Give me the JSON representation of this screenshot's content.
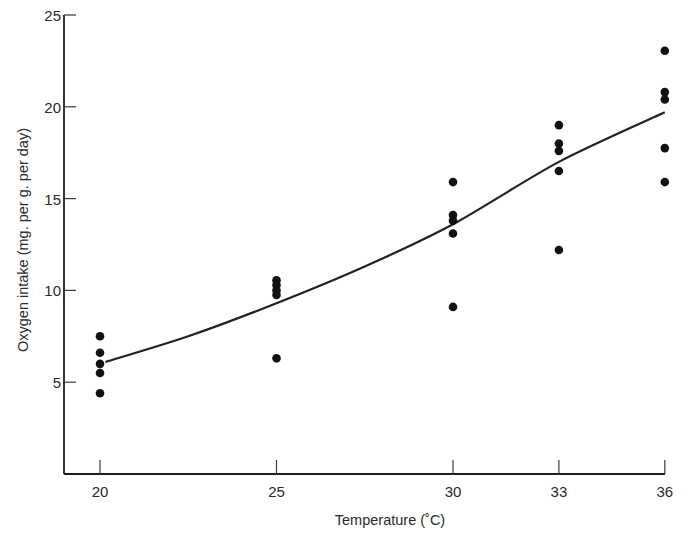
{
  "chart_data": {
    "type": "scatter",
    "title": "",
    "xlabel": "Temperature (˚C)",
    "ylabel": "Oxygen intake (mg. per g. per day)",
    "xlim": [
      18.95,
      36
    ],
    "ylim": [
      0,
      25
    ],
    "grid": false,
    "legend": null,
    "x_ticks": [
      20,
      25,
      30,
      33,
      36
    ],
    "x_tick_labels": [
      "20",
      "25",
      "30",
      "33",
      "36"
    ],
    "y_ticks": [
      5,
      10,
      15,
      20,
      25
    ],
    "y_tick_labels": [
      "5",
      "10",
      "15",
      "20",
      "25"
    ],
    "series": [
      {
        "name": "Observations",
        "kind": "scatter",
        "points": [
          {
            "x": 20,
            "y": 7.5
          },
          {
            "x": 20,
            "y": 6.6
          },
          {
            "x": 20,
            "y": 6.0
          },
          {
            "x": 20,
            "y": 5.5
          },
          {
            "x": 20,
            "y": 4.4
          },
          {
            "x": 25,
            "y": 10.55
          },
          {
            "x": 25,
            "y": 10.3
          },
          {
            "x": 25,
            "y": 10.0
          },
          {
            "x": 25,
            "y": 9.75
          },
          {
            "x": 25,
            "y": 6.3
          },
          {
            "x": 30,
            "y": 15.9
          },
          {
            "x": 30,
            "y": 14.1
          },
          {
            "x": 30,
            "y": 13.8
          },
          {
            "x": 30,
            "y": 13.1
          },
          {
            "x": 30,
            "y": 9.1
          },
          {
            "x": 33,
            "y": 19.0
          },
          {
            "x": 33,
            "y": 18.0
          },
          {
            "x": 33,
            "y": 17.6
          },
          {
            "x": 33,
            "y": 16.5
          },
          {
            "x": 33,
            "y": 12.2
          },
          {
            "x": 36,
            "y": 23.05
          },
          {
            "x": 36,
            "y": 20.8
          },
          {
            "x": 36,
            "y": 20.4
          },
          {
            "x": 36,
            "y": 17.75
          },
          {
            "x": 36,
            "y": 15.9
          }
        ]
      },
      {
        "name": "Mean curve",
        "kind": "line",
        "points": [
          {
            "x": 20.15,
            "y": 6.1
          },
          {
            "x": 22.5,
            "y": 7.5
          },
          {
            "x": 25,
            "y": 9.3
          },
          {
            "x": 27.5,
            "y": 11.3
          },
          {
            "x": 30,
            "y": 13.6
          },
          {
            "x": 33,
            "y": 17.0
          },
          {
            "x": 36,
            "y": 19.7
          }
        ]
      }
    ]
  }
}
